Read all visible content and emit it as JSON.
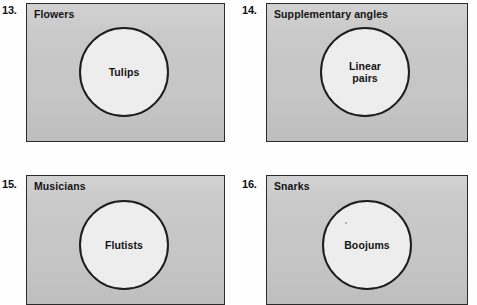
{
  "page": {
    "background_color": "#ffffff",
    "universe_fill": "#c8c8c8",
    "universe_stroke": "#2b2b2b",
    "subset_fill": "#ededed",
    "subset_stroke": "#1d1d1d",
    "text_color": "#141414"
  },
  "exercises": [
    {
      "number": "13.",
      "universe_label": "Flowers",
      "subset_label": "Tulips"
    },
    {
      "number": "14.",
      "universe_label": "Supplementary angles",
      "subset_label": "Linear\npairs"
    },
    {
      "number": "15.",
      "universe_label": "Musicians",
      "subset_label": "Flutists"
    },
    {
      "number": "16.",
      "universe_label": "Snarks",
      "subset_label": "Boojums"
    }
  ]
}
